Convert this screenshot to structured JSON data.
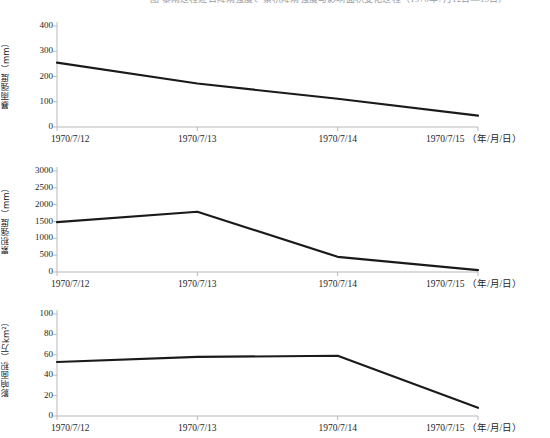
{
  "header": {
    "clipped_caption": "图 暴雨过程逐日降雨强度、累积降雨强度与影响面积变化过程（1970年7月12日—15日）"
  },
  "axis": {
    "x_categories": [
      "1970/7/12",
      "1970/7/13",
      "1970/7/14",
      "1970/7/15"
    ],
    "x_unit_note": "（年/月/日）",
    "x_last_label": "1970/7/15 （年/月/日）"
  },
  "colors": {
    "line": "#1a1a1a",
    "axis": "#b9b9bd",
    "text": "#262626",
    "background": "#ffffff"
  },
  "chart_data": [
    {
      "type": "line",
      "title": "",
      "xlabel": "（年/月/日）",
      "ylabel": "暴雨强度（mm）",
      "categories": [
        "1970/7/12",
        "1970/7/13",
        "1970/7/14",
        "1970/7/15"
      ],
      "values": [
        255,
        172,
        112,
        45
      ],
      "yticks": [
        0,
        100,
        200,
        300,
        400
      ],
      "ylim": [
        0,
        400
      ],
      "grid": false,
      "legend": "none"
    },
    {
      "type": "line",
      "title": "",
      "xlabel": "（年/月/日）",
      "ylabel": "累积强度（mm）",
      "categories": [
        "1970/7/12",
        "1970/7/13",
        "1970/7/14",
        "1970/7/15"
      ],
      "values": [
        1480,
        1790,
        450,
        55
      ],
      "yticks": [
        0,
        500,
        1000,
        1500,
        2000,
        2500,
        3000
      ],
      "ylim": [
        0,
        3000
      ],
      "grid": false,
      "legend": "none"
    },
    {
      "type": "line",
      "title": "",
      "xlabel": "（年/月/日）",
      "ylabel": "影响面积（万km²）",
      "categories": [
        "1970/7/12",
        "1970/7/13",
        "1970/7/14",
        "1970/7/15"
      ],
      "values": [
        53,
        58,
        59,
        8
      ],
      "yticks": [
        0,
        20,
        40,
        60,
        80,
        100
      ],
      "ylim": [
        0,
        100
      ],
      "grid": false,
      "legend": "none"
    }
  ]
}
